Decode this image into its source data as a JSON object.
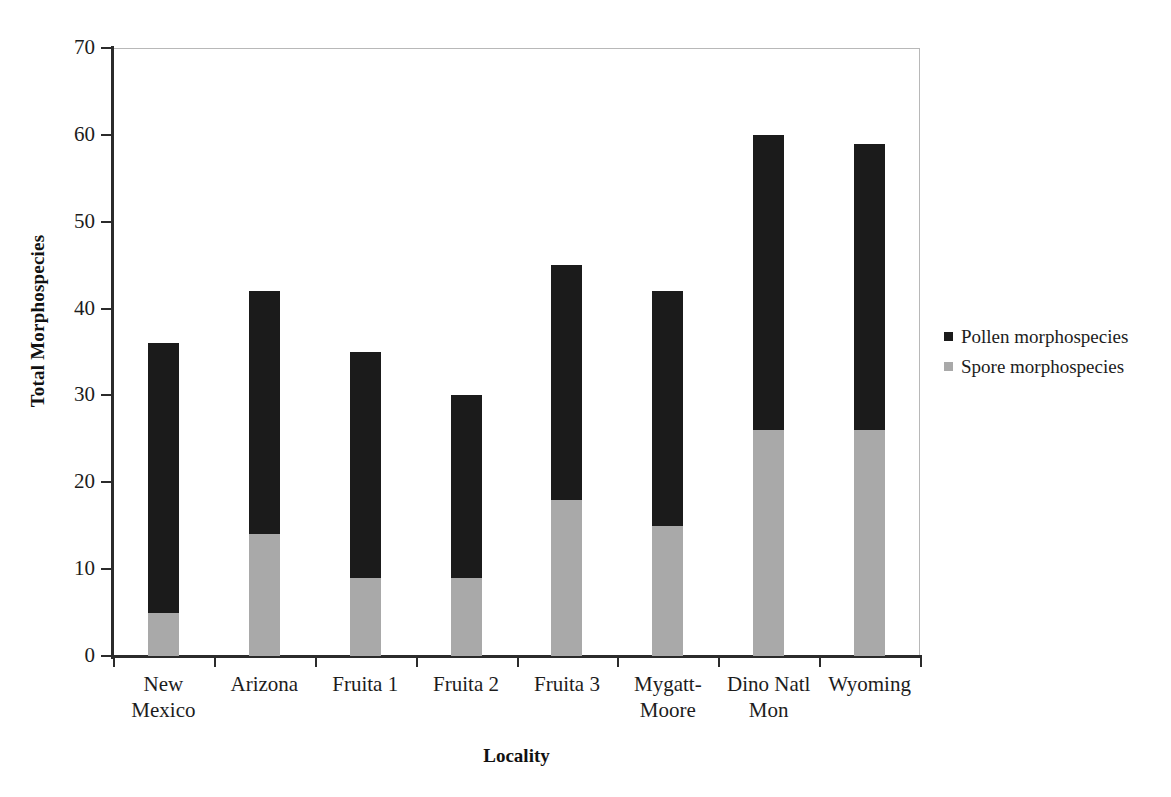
{
  "chart_data": {
    "type": "bar",
    "stacked": true,
    "title": "",
    "xlabel": "Locality",
    "ylabel": "Total Morphospecies",
    "ylim": [
      0,
      70
    ],
    "yticks": [
      0,
      10,
      20,
      30,
      40,
      50,
      60,
      70
    ],
    "grid": false,
    "legend_position": "right",
    "categories": [
      "New Mexico",
      "Arizona",
      "Fruita 1",
      "Fruita 2",
      "Fruita 3",
      "Mygatt-Moore",
      "Dino Natl Mon",
      "Wyoming"
    ],
    "category_lines": [
      [
        "New",
        "Mexico"
      ],
      [
        "Arizona"
      ],
      [
        "Fruita 1"
      ],
      [
        "Fruita 2"
      ],
      [
        "Fruita 3"
      ],
      [
        "Mygatt-",
        "Moore"
      ],
      [
        "Dino Natl",
        "Mon"
      ],
      [
        "Wyoming"
      ]
    ],
    "series": [
      {
        "name": "Spore morphospecies",
        "color": "#a9a9a9",
        "values": [
          5,
          14,
          9,
          9,
          18,
          15,
          26,
          26
        ]
      },
      {
        "name": "Pollen morphospecies",
        "color": "#1b1b1b",
        "values": [
          31,
          28,
          26,
          21,
          27,
          27,
          34,
          33
        ]
      }
    ],
    "totals": [
      36,
      42,
      35,
      30,
      45,
      42,
      60,
      59
    ]
  },
  "axes": {
    "y_title": "Total Morphospecies",
    "x_title": "Locality",
    "y_tick_labels": [
      "0",
      "10",
      "20",
      "30",
      "40",
      "50",
      "60",
      "70"
    ]
  },
  "legend": {
    "items": [
      {
        "label": "Pollen morphospecies",
        "color": "#1b1b1b",
        "swatch": "legend-swatch-pollen"
      },
      {
        "label": "Spore morphospecies",
        "color": "#a9a9a9",
        "swatch": "legend-swatch-spore"
      }
    ]
  },
  "colors": {
    "pollen": "#1b1b1b",
    "spore": "#a9a9a9",
    "axis": "#2b2b2b",
    "frame": "#b8b8b8",
    "background": "#ffffff",
    "text": "#1c1c1c"
  }
}
